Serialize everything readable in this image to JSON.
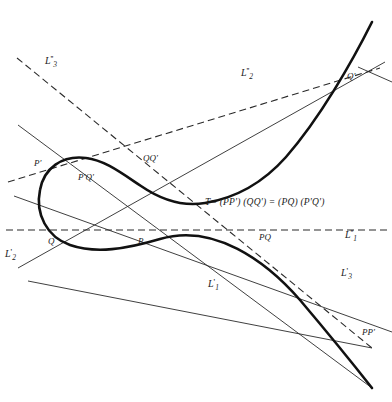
{
  "figure": {
    "background_color": "#ffffff",
    "ink_color": "#1a1a1a",
    "curve_color": "#111111"
  },
  "equation": {
    "text": "T= (PP') (QQ') = (PQ) (P'Q')",
    "x": 205,
    "y": 203
  },
  "point_labels": [
    {
      "id": "P-prime",
      "text": "P'",
      "x": 34,
      "y": 164
    },
    {
      "id": "P-prime-Q-prime",
      "text": "P'Q'",
      "x": 78,
      "y": 178
    },
    {
      "id": "Q-Q-prime",
      "text": "QQ'",
      "x": 143,
      "y": 159
    },
    {
      "id": "Q",
      "text": "Q",
      "x": 48,
      "y": 242
    },
    {
      "id": "P",
      "text": "P",
      "x": 138,
      "y": 242
    },
    {
      "id": "P-Q",
      "text": "PQ",
      "x": 259,
      "y": 238
    },
    {
      "id": "Q-prime",
      "text": "Q'",
      "x": 347,
      "y": 77
    },
    {
      "id": "P-P-prime",
      "text": "PP'",
      "x": 362,
      "y": 333
    }
  ],
  "line_labels": [
    {
      "id": "L3-double-prime",
      "base": "L",
      "sub": "3",
      "primes": "''",
      "x": 45,
      "y": 60
    },
    {
      "id": "L2-double-prime",
      "base": "L",
      "sub": "2",
      "primes": "''",
      "x": 241,
      "y": 72
    },
    {
      "id": "L1-double-prime",
      "base": "L",
      "sub": "1",
      "primes": "''",
      "x": 345,
      "y": 234
    },
    {
      "id": "L2-prime",
      "base": "L",
      "sub": "2",
      "primes": "'",
      "x": 5,
      "y": 253
    },
    {
      "id": "L1-prime",
      "base": "L",
      "sub": "1",
      "primes": "'",
      "x": 208,
      "y": 283
    },
    {
      "id": "L3-prime",
      "base": "L",
      "sub": "3",
      "primes": "'",
      "x": 341,
      "y": 272
    }
  ],
  "geometry": {
    "cubic_curve": "M 372,22 C 352,62 320,118 286,157 C 262,184 236,198 205,203 C 182,207 160,199 141,186 C 120,172 104,160 86,158 C 62,155 44,168 40,190 C 35,214 47,237 70,245 C 96,254 126,249 160,239 C 214,223 266,261 300,300 C 322,326 350,360 372,388",
    "solid_lines": [
      {
        "id": "chord-P-prime-Q-prime",
        "x1": 18,
        "y1": 125,
        "x2": 372,
        "y2": 388
      },
      {
        "id": "chord-Q-Q-prime",
        "x1": 14,
        "y1": 196,
        "x2": 392,
        "y2": 332
      },
      {
        "id": "chord-P-Q",
        "x1": 18,
        "y1": 268,
        "x2": 385,
        "y2": 62
      },
      {
        "id": "chord-P-P-prime",
        "x1": 28,
        "y1": 281,
        "x2": 372,
        "y2": 348
      },
      {
        "id": "tangent-Q-prime",
        "x1": 360,
        "y1": 68,
        "x2": 392,
        "y2": 82
      }
    ],
    "dashed_lines": [
      {
        "id": "L3-double-prime-line",
        "x1": 17,
        "y1": 58,
        "x2": 372,
        "y2": 348
      },
      {
        "id": "L2-double-prime-line",
        "x1": 8,
        "y1": 182,
        "x2": 380,
        "y2": 68
      },
      {
        "id": "L1-double-prime-line",
        "x1": 6,
        "y1": 230,
        "x2": 388,
        "y2": 230
      }
    ]
  }
}
